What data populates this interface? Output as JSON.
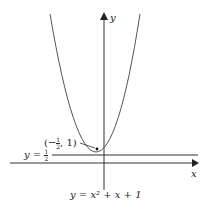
{
  "figure": {
    "equation_label": "y = x² + x + 1",
    "x_axis_label": "x",
    "y_axis_label": "y",
    "point_label": {
      "prefix": "(−",
      "num": "1",
      "den": "2",
      "suffix": ", 1)"
    },
    "line_label": {
      "prefix": "y = ",
      "num": "1",
      "den": "2"
    },
    "colors": {
      "curve": "#555555",
      "axis": "#333333"
    }
  }
}
